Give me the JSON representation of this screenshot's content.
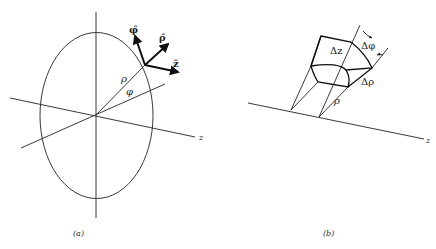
{
  "figure": {
    "panel_a": {
      "caption": "(a)",
      "axis_label_z": "z",
      "radius_label": "ρ",
      "angle_label": "φ",
      "unit_vectors": [
        {
          "name": "phi-hat",
          "label": "φ̂"
        },
        {
          "name": "rho-hat",
          "label": "ρ̂"
        },
        {
          "name": "z-hat",
          "label": "ẑ"
        }
      ]
    },
    "panel_b": {
      "caption": "(b)",
      "axis_label_z": "z",
      "radius_label": "ρ",
      "delta_z_label": "Δz",
      "delta_phi_label": "Δφ",
      "delta_rho_label": "Δρ"
    }
  }
}
